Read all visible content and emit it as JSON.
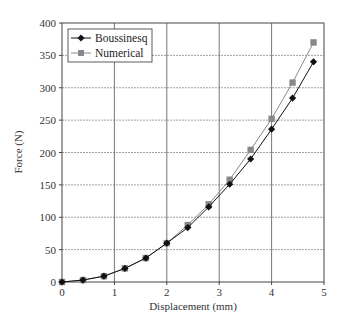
{
  "chart_data": {
    "type": "line",
    "title": "",
    "xlabel": "Displacement (mm)",
    "ylabel": "Force (N)",
    "xlim": [
      0,
      5
    ],
    "ylim": [
      0,
      400
    ],
    "xticks": [
      0,
      1,
      2,
      3,
      4,
      5
    ],
    "yticks": [
      0,
      50,
      100,
      150,
      200,
      250,
      300,
      350,
      400
    ],
    "grid": true,
    "legend_position": "upper left",
    "x": [
      0,
      0.4,
      0.8,
      1.2,
      1.6,
      2.0,
      2.4,
      2.8,
      3.2,
      3.6,
      4.0,
      4.4,
      4.8
    ],
    "series": [
      {
        "name": "Boussinesq",
        "marker": "diamond",
        "color": "#111111",
        "values": [
          0,
          3,
          9,
          21,
          37,
          60,
          84,
          116,
          151,
          190,
          236,
          284,
          340
        ]
      },
      {
        "name": "Numerical",
        "marker": "square",
        "color": "#888888",
        "values": [
          0,
          3,
          9,
          21,
          37,
          60,
          88,
          120,
          158,
          204,
          252,
          308,
          370
        ]
      }
    ]
  }
}
